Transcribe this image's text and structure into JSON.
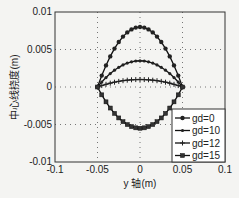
{
  "chart_data": {
    "type": "line",
    "title": "",
    "xlabel": "y 轴(m)",
    "ylabel": "中心线挠度(m)",
    "xlim": [
      -0.1,
      0.1
    ],
    "ylim": [
      -0.01,
      0.01
    ],
    "xticks": [
      "-0.1",
      "-0.05",
      "0",
      "0.05",
      "0.1"
    ],
    "yticks": [
      "0.01",
      "0.005",
      "0",
      "-0.005",
      "-0.01"
    ],
    "grid": true,
    "legend_position": "lower right",
    "x": [
      -0.05,
      -0.045,
      -0.04,
      -0.035,
      -0.03,
      -0.025,
      -0.02,
      -0.015,
      -0.01,
      -0.005,
      0,
      0.005,
      0.01,
      0.015,
      0.02,
      0.025,
      0.03,
      0.035,
      0.04,
      0.045,
      0.05
    ],
    "series": [
      {
        "name": "gd=0",
        "marker": "circle",
        "peak": 0.008
      },
      {
        "name": "gd=10",
        "marker": "dot",
        "peak": 0.0035
      },
      {
        "name": "gd=12",
        "marker": "plus",
        "peak": 0.001
      },
      {
        "name": "gd=15",
        "marker": "square",
        "peak": -0.0055
      }
    ]
  }
}
